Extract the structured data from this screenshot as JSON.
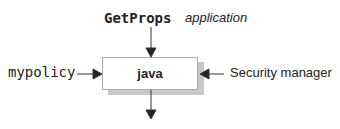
{
  "diagram": {
    "top_label": "GetProps",
    "top_annotation": "application",
    "center_box": "java",
    "left_input": "mypolicy",
    "right_input": "Security manager"
  }
}
